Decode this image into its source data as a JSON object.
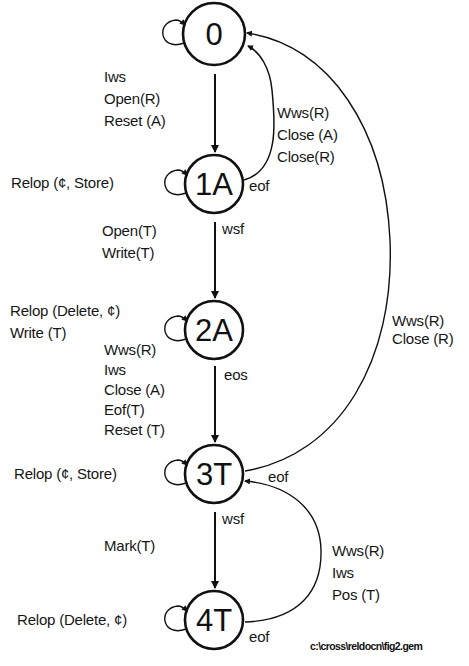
{
  "diagram": {
    "type": "state-transition-diagram",
    "states": [
      {
        "id": "0",
        "label": "0",
        "cx": 214,
        "cy": 34
      },
      {
        "id": "1A",
        "label": "1A",
        "cx": 214,
        "cy": 184
      },
      {
        "id": "2A",
        "label": "2A",
        "cx": 214,
        "cy": 330
      },
      {
        "id": "3T",
        "label": "3T",
        "cx": 214,
        "cy": 474
      },
      {
        "id": "4T",
        "label": "4T",
        "cx": 214,
        "cy": 620
      }
    ],
    "transitions": [
      {
        "from": "0",
        "to": "1A",
        "condition": "",
        "actions": [
          "Iws",
          "Open(R)",
          "Reset (A)"
        ]
      },
      {
        "from": "1A",
        "to": "0",
        "condition": "eof",
        "actions": [
          "Wws(R)",
          "Close (A)",
          "Close(R)"
        ]
      },
      {
        "from": "1A",
        "to": "2A",
        "condition": "wsf",
        "actions": [
          "Open(T)",
          "Write(T)"
        ]
      },
      {
        "from": "2A",
        "to": "3T",
        "condition": "eos",
        "actions": [
          "Wws(R)",
          "Iws",
          "Close (A)",
          "Eof(T)",
          "Reset (T)"
        ]
      },
      {
        "from": "3T",
        "to": "0",
        "condition": "eof",
        "actions": [
          "Wws(R)",
          "Close (R)"
        ]
      },
      {
        "from": "3T",
        "to": "4T",
        "condition": "wsf",
        "actions": [
          "Mark(T)"
        ]
      },
      {
        "from": "4T",
        "to": "3T",
        "condition": "eof",
        "actions": [
          "Wws(R)",
          "Iws",
          "Pos (T)"
        ]
      }
    ],
    "self_loops": [
      {
        "state": "0",
        "actions": []
      },
      {
        "state": "1A",
        "actions": [
          "Relop (¢, Store)"
        ]
      },
      {
        "state": "2A",
        "actions": [
          "Relop (Delete, ¢)",
          "Write (T)"
        ]
      },
      {
        "state": "3T",
        "actions": [
          "Relop (¢, Store)"
        ]
      },
      {
        "state": "4T",
        "actions": [
          "Relop (Delete, ¢)"
        ]
      }
    ],
    "filename": "c:\\cross\\reldocn\\fig2.gem"
  },
  "labels": {
    "t0_1a": [
      "Iws",
      "Open(R)",
      "Reset (A)"
    ],
    "t1a_0": [
      "Wws(R)",
      "Close (A)",
      "Close(R)"
    ],
    "t1a_0_cond": "eof",
    "loop_1a": "Relop (¢, Store)",
    "t1a_2a_cond": "wsf",
    "t1a_2a": [
      "Open(T)",
      "Write(T)"
    ],
    "loop_2a": [
      "Relop (Delete, ¢)",
      "Write (T)"
    ],
    "t2a_3t": [
      "Wws(R)",
      "Iws",
      "Close (A)",
      "Eof(T)",
      "Reset (T)"
    ],
    "t2a_3t_cond": "eos",
    "t3t_0": [
      "Wws(R)",
      "Close (R)"
    ],
    "t3t_0_cond": "eof",
    "loop_3t": "Relop (¢, Store)",
    "t3t_4t_cond": "wsf",
    "t3t_4t": [
      "Mark(T)"
    ],
    "t4t_3t": [
      "Wws(R)",
      "Iws",
      "Pos (T)"
    ],
    "t4t_3t_cond": "eof",
    "loop_4t": "Relop (Delete, ¢)",
    "filepath": "c:\\cross\\reldocn\\fig2.gem"
  },
  "colors": {
    "ink": "#111111",
    "background": "#ffffff"
  }
}
